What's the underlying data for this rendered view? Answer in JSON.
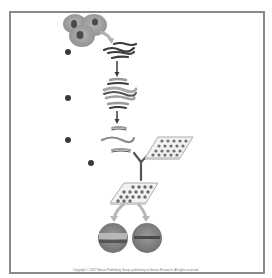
{
  "figure": {
    "steps": [
      {
        "label": "a",
        "description": "cells -> extracted nucleic acid strands"
      },
      {
        "label": "b",
        "description": "amplified / labelled strands"
      },
      {
        "label": "c",
        "description": "fragmented labelled strands"
      },
      {
        "label": "d",
        "description": "hybridization to microarray"
      }
    ],
    "result_spots": [
      {
        "name": "spot-left",
        "band": "light"
      },
      {
        "name": "spot-right",
        "band": "dark"
      }
    ],
    "copyright": "Copyright © 2007 Nature Publishing Group, publishing as Nature Research. All rights reserved."
  },
  "colors": {
    "frame": "#8a8a8a",
    "dark": "#3c3c3c",
    "mid": "#8c8c8c",
    "light": "#c8c8c8",
    "background": "#ffffff"
  }
}
